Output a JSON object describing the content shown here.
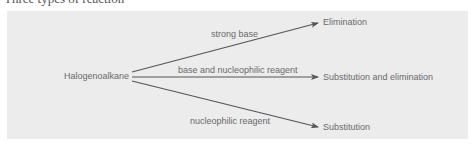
{
  "heading": {
    "text": "Three types of reaction"
  },
  "diagram": {
    "source": {
      "label": "Halogenoalkane"
    },
    "branches": [
      {
        "condition": "strong base",
        "product": "Elimination"
      },
      {
        "condition": "base and nucleophilic reagent",
        "product": "Substitution and elimination"
      },
      {
        "condition": "nucleophilic reagent",
        "product": "Substitution"
      }
    ],
    "colors": {
      "panel": "#ececec",
      "arrow": "#555555",
      "text": "#6a6a6a"
    }
  }
}
